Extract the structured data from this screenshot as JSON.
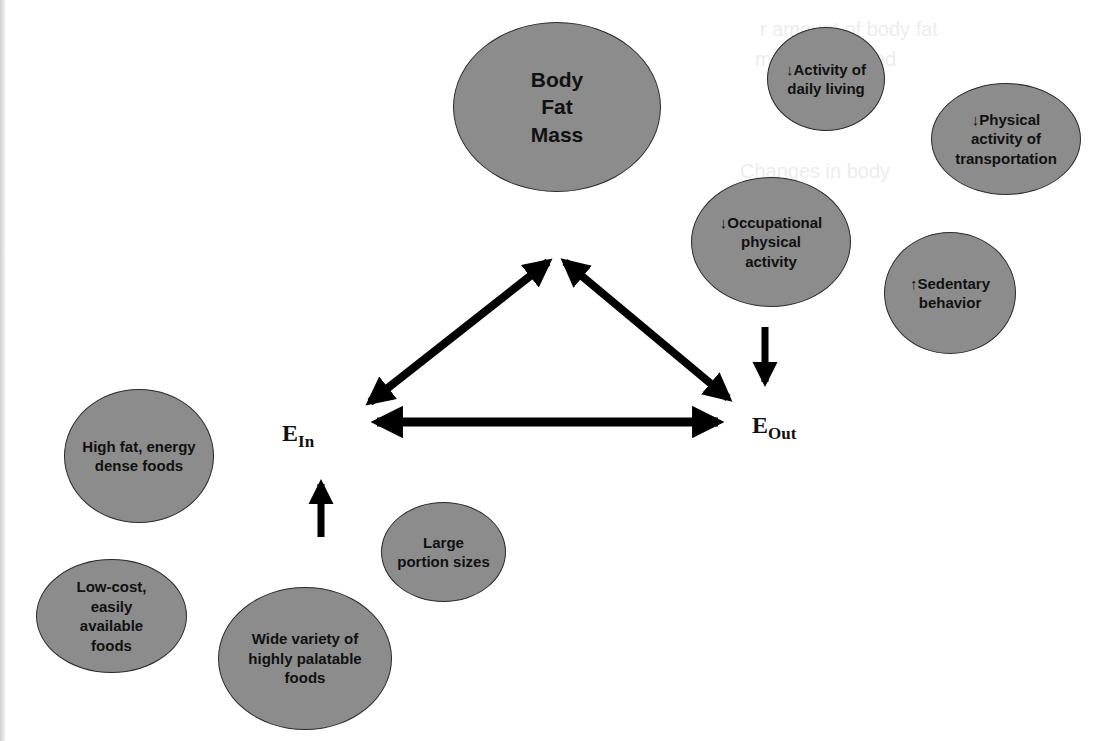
{
  "figure": {
    "type": "concept-diagram",
    "center": {
      "body_fat_mass": "Body\nFat\nMass",
      "energy_in": {
        "base": "E",
        "sub": "In"
      },
      "energy_out": {
        "base": "E",
        "sub": "Out"
      }
    },
    "energy_out_factors": [
      {
        "id": "daily-living",
        "label": "↓Activity of\ndaily living"
      },
      {
        "id": "transportation",
        "label": "↓Physical\nactivity of\ntransportation"
      },
      {
        "id": "occupational",
        "label": "↓Occupational\nphysical\nactivity"
      },
      {
        "id": "sedentary",
        "label": "↑Sedentary\nbehavior"
      }
    ],
    "energy_in_factors": [
      {
        "id": "high-fat",
        "label": "High fat, energy\ndense  foods"
      },
      {
        "id": "low-cost",
        "label": "Low-cost,\neasily\navailable\nfoods"
      },
      {
        "id": "wide-variety",
        "label": "Wide variety of\nhighly palatable\nfoods"
      },
      {
        "id": "large-portion",
        "label": "Large\nportion sizes"
      }
    ],
    "arrows": [
      {
        "from": "E_In",
        "to": "Body Fat Mass",
        "type": "bidirectional"
      },
      {
        "from": "Body Fat Mass",
        "to": "E_Out",
        "type": "bidirectional"
      },
      {
        "from": "E_In",
        "to": "E_Out",
        "type": "bidirectional"
      },
      {
        "from": "energy_in_factors",
        "to": "E_In",
        "type": "up"
      },
      {
        "from": "energy_out_factors",
        "to": "E_Out",
        "type": "down"
      }
    ],
    "colors": {
      "node_fill": "#8c8c8c",
      "node_border": "#2a2a2a",
      "arrow": "#000000",
      "background": "#ffffff"
    }
  }
}
